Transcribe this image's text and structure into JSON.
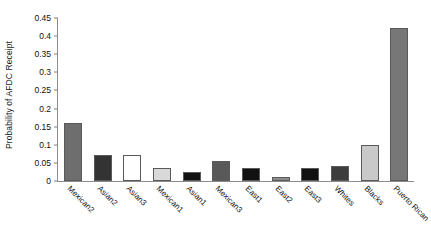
{
  "chart_data": {
    "type": "bar",
    "title": "",
    "xlabel": "",
    "ylabel": "Probability of AFDC Receipt",
    "ylim": [
      0,
      0.45
    ],
    "yticks": [
      "0",
      "0.05",
      "0.1",
      "0.15",
      "0.2",
      "0.25",
      "0.3",
      "0.35",
      "0.4",
      "0.45"
    ],
    "ytick_values": [
      0,
      0.05,
      0.1,
      0.15,
      0.2,
      0.25,
      0.3,
      0.35,
      0.4,
      0.45
    ],
    "grid": false,
    "legend": "none",
    "categories": [
      "Mexican2",
      "Asian2",
      "Asian3",
      "Mexican1",
      "Asian1",
      "Mexican3",
      "East1",
      "East2",
      "East3",
      "Whites",
      "Blacks",
      "Puerto Rican"
    ],
    "values": [
      0.16,
      0.072,
      0.072,
      0.035,
      0.024,
      0.054,
      0.035,
      0.011,
      0.036,
      0.042,
      0.099,
      0.422
    ],
    "bar_colors": [
      "#6e6e6e",
      "#333333",
      "#ffffff",
      "#d9d9d9",
      "#111111",
      "#595959",
      "#111111",
      "#8c8c8c",
      "#111111",
      "#3d3d3d",
      "#c9c9c9",
      "#777777"
    ]
  },
  "axis": {
    "tick_color": "#808080",
    "line_color": "#8c8c8c"
  }
}
